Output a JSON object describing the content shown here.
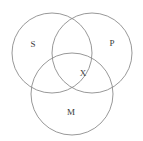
{
  "diagram": {
    "type": "venn",
    "background_color": "#ffffff",
    "stroke_color": "#8c8c8c",
    "text_color": "#3a3a3a",
    "canvas": {
      "width": 143,
      "height": 141
    },
    "circles": [
      {
        "id": "circle-s",
        "label": "S",
        "cx": 52,
        "cy": 53,
        "r": 40
      },
      {
        "id": "circle-p",
        "label": "P",
        "cx": 92,
        "cy": 53,
        "r": 40
      },
      {
        "id": "circle-m",
        "label": "M",
        "cx": 72,
        "cy": 94,
        "r": 41
      }
    ],
    "labels": [
      {
        "id": "label-s",
        "text": "S",
        "x": 33,
        "y": 45
      },
      {
        "id": "label-p",
        "text": "P",
        "x": 112,
        "y": 44
      },
      {
        "id": "label-m",
        "text": "M",
        "x": 71,
        "y": 113
      },
      {
        "id": "label-x",
        "text": "X",
        "x": 83,
        "y": 74
      }
    ],
    "marks": {
      "x_mark": "X",
      "x_region": "center-intersection"
    }
  }
}
